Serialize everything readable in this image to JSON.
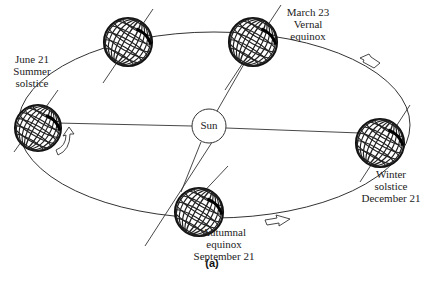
{
  "diagram": {
    "type": "orbit-seasons",
    "caption": "(a)",
    "center_body": {
      "label": "Sun"
    },
    "positions": [
      {
        "id": "summer",
        "lines": [
          "June 21",
          "Summer",
          "solstice"
        ]
      },
      {
        "id": "vernal",
        "lines": [
          "March 23",
          "Vernal",
          "equinox"
        ]
      },
      {
        "id": "winter",
        "lines": [
          "Winter",
          "solstice",
          "December 21"
        ]
      },
      {
        "id": "autumnal",
        "lines": [
          "Autumnal",
          "equinox",
          "September 21"
        ]
      },
      {
        "id": "unlabeled",
        "lines": []
      }
    ],
    "arrows": [
      {
        "id": "orbit-arrow-upper-right",
        "direction": "counterclockwise"
      },
      {
        "id": "orbit-arrow-lower-right",
        "direction": "counterclockwise"
      },
      {
        "id": "rotation-arrow-left",
        "meaning": "earth rotation"
      }
    ],
    "colors": {
      "stroke": "#222222",
      "background": "#ffffff"
    }
  }
}
